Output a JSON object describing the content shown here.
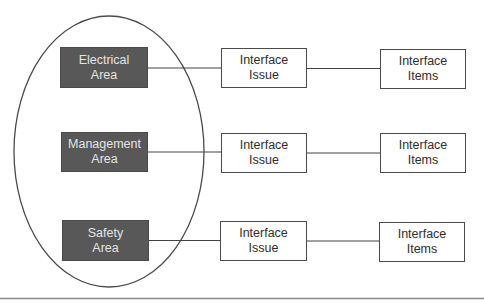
{
  "diagram": {
    "colors": {
      "area_fill": "#585858",
      "area_text": "#e4e4e4",
      "box_border": "#4a4a4a",
      "box_text": "#2e2e2e",
      "line": "#444444",
      "ellipse": "#4a4a4a",
      "rule": "#8a8a8a"
    },
    "rows": [
      {
        "area": {
          "line1": "Electrical",
          "line2": "Area"
        },
        "issue": {
          "line1": "Interface",
          "line2": "Issue"
        },
        "items": {
          "line1": "Interface",
          "line2": "Items"
        }
      },
      {
        "area": {
          "line1": "Management",
          "line2": "Area"
        },
        "issue": {
          "line1": "Interface",
          "line2": "Issue"
        },
        "items": {
          "line1": "Interface",
          "line2": "Items"
        }
      },
      {
        "area": {
          "line1": "Safety",
          "line2": "Area"
        },
        "issue": {
          "line1": "Interface",
          "line2": "Issue"
        },
        "items": {
          "line1": "Interface",
          "line2": "Items"
        }
      }
    ]
  }
}
